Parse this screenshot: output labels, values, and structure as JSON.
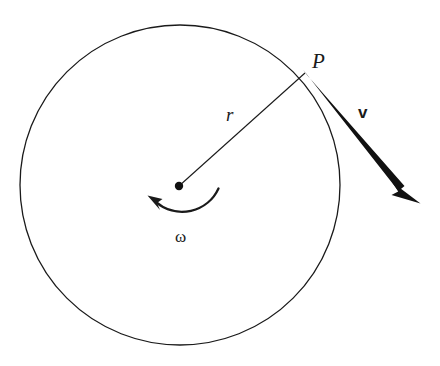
{
  "figure": {
    "background_color": "#ffffff",
    "stroke_color": "#1a1a1a",
    "width": 440,
    "height": 366
  },
  "labels": {
    "point": "P",
    "radius": "r",
    "velocity": "v",
    "angular_velocity": "ω"
  },
  "geometry": {
    "circle": {
      "center_x": 180,
      "center_y": 185,
      "radius": 160,
      "stroke_width": 1.3
    },
    "center_dot": {
      "cx": 179,
      "cy": 186,
      "r": 4.2
    },
    "radius_line": {
      "x1": 179,
      "y1": 186,
      "x2": 305,
      "y2": 73,
      "stroke_width": 1.1
    },
    "velocity_vector": {
      "x1": 305,
      "y1": 72,
      "x2": 420,
      "y2": 203,
      "tail_width": 5.5,
      "head_length": 30,
      "head_width": 14
    },
    "rotation_arc": {
      "start_x": 218,
      "start_y": 189,
      "end_x": 153,
      "end_y": 203,
      "sweep_radius": 39,
      "stroke_width": 2.2,
      "direction": "counterclockwise",
      "head_length": 17,
      "head_width": 9
    }
  }
}
